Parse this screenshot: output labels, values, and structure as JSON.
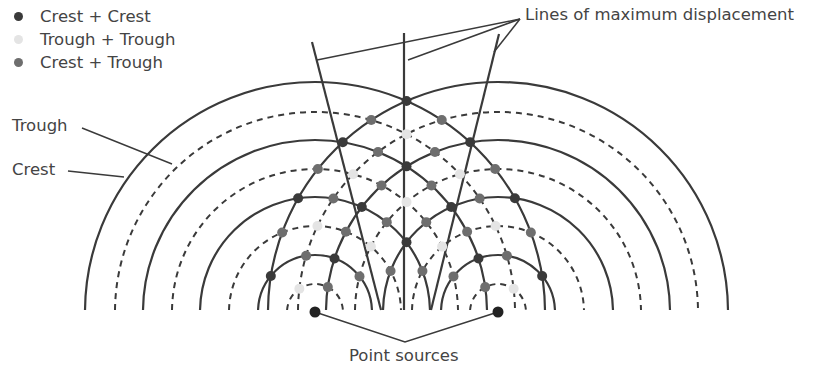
{
  "legend": {
    "items": [
      {
        "label": "Crest + Crest",
        "color": "#3a3a3a"
      },
      {
        "label": "Trough + Trough",
        "color": "#e4e4e4"
      },
      {
        "label": "Crest + Trough",
        "color": "#6e6e6e"
      }
    ]
  },
  "labels": {
    "max_lines": "Lines of maximum displacement",
    "trough": "Trough",
    "crest": "Crest",
    "sources": "Point sources"
  },
  "colors": {
    "line": "#3a3a3a",
    "crest_crest": "#3a3a3a",
    "trough_trough": "#e4e4e4",
    "crest_trough": "#6e6e6e"
  },
  "geometry": {
    "baseline_y": 310,
    "sources": [
      {
        "x": 315,
        "y": 312
      },
      {
        "x": 498,
        "y": 312
      }
    ],
    "crest_radii": [
      57,
      115,
      172,
      230
    ],
    "trough_radii": [
      28,
      86,
      143,
      200
    ],
    "max_lines": [
      {
        "x1": 312,
        "y1": 42,
        "x2": 381,
        "y2": 310
      },
      {
        "x1": 404,
        "y1": 33,
        "x2": 404,
        "y2": 310
      },
      {
        "x1": 499,
        "y1": 34,
        "x2": 431,
        "y2": 310
      }
    ],
    "max_leader": {
      "from": {
        "x": 520,
        "y": 19
      },
      "to": [
        {
          "x": 317,
          "y": 60
        },
        {
          "x": 408,
          "y": 60
        },
        {
          "x": 494,
          "y": 52
        }
      ]
    },
    "trough_leader": {
      "x1": 82,
      "y1": 128,
      "x2": 172,
      "y2": 164
    },
    "crest_leader": {
      "x1": 68,
      "y1": 171,
      "x2": 124,
      "y2": 177
    },
    "sources_leader": {
      "apex": {
        "x": 405,
        "y": 342
      }
    }
  }
}
